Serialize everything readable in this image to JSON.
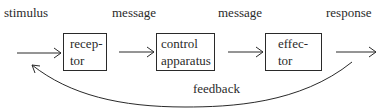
{
  "diagram": {
    "labels": {
      "stimulus": "stimulus",
      "message_1": "message",
      "message_2": "message",
      "response": "response",
      "feedback": "feedback"
    },
    "boxes": [
      {
        "id": "receptor",
        "lines": [
          "recep-",
          "tor"
        ]
      },
      {
        "id": "control-apparatus",
        "lines": [
          "control",
          "apparatus"
        ]
      },
      {
        "id": "effector",
        "lines": [
          "effec-",
          "tor"
        ]
      }
    ],
    "edges": [
      {
        "from": "stimulus",
        "to": "receptor",
        "label": ""
      },
      {
        "from": "receptor",
        "to": "control-apparatus",
        "label": "message"
      },
      {
        "from": "control-apparatus",
        "to": "effector",
        "label": "message"
      },
      {
        "from": "effector",
        "to": "response",
        "label": ""
      },
      {
        "from": "response",
        "to": "stimulus",
        "label": "feedback",
        "style": "curved"
      }
    ],
    "colors": {
      "line": "#2a2a2a",
      "background": "#ffffff"
    }
  }
}
